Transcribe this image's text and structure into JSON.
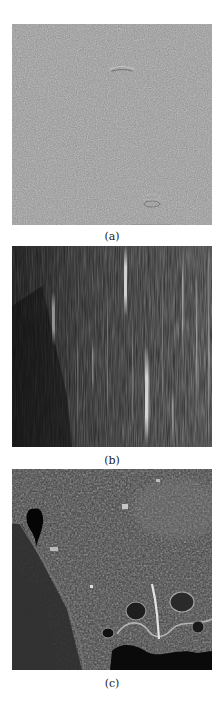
{
  "figure": {
    "panels": [
      {
        "label": "(a)",
        "description": "Uniform mid-gray noise texture with faint horizontal streak artifacts",
        "base_color": "#8e8e8e"
      },
      {
        "label": "(b)",
        "description": "Dark image with vertical bright streaks (stripe noise)",
        "base_color": "#2e2e2e"
      },
      {
        "label": "(c)",
        "description": "Grayscale aerial/SAR-like terrain image with dark lake at upper left and river/coastline",
        "base_color": "#3c3c3c"
      }
    ]
  }
}
